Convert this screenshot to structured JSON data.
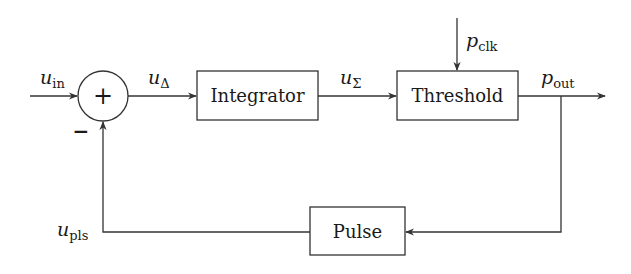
{
  "diagram": {
    "type": "control-loop block diagram",
    "colors": {
      "stroke": "#333333",
      "text": "#1a1a1a",
      "background": "#ffffff"
    },
    "summing_junction": {
      "symbol": "+",
      "feedback_sign": "−"
    },
    "blocks": {
      "integrator": "Integrator",
      "threshold": "Threshold",
      "pulse": "Pulse"
    },
    "signals": {
      "u_in": {
        "base": "u",
        "sub": "in"
      },
      "u_delta": {
        "base": "u",
        "sub": "Δ"
      },
      "u_sigma": {
        "base": "u",
        "sub": "Σ"
      },
      "p_clk": {
        "base": "p",
        "sub": "clk"
      },
      "p_out": {
        "base": "p",
        "sub": "out"
      },
      "u_pls": {
        "base": "u",
        "sub": "pls"
      }
    },
    "connections": [
      {
        "from": "u_in",
        "to": "summing_junction"
      },
      {
        "from": "summing_junction",
        "to": "integrator",
        "signal": "u_delta"
      },
      {
        "from": "integrator",
        "to": "threshold",
        "signal": "u_sigma"
      },
      {
        "from": "p_clk",
        "to": "threshold"
      },
      {
        "from": "threshold",
        "to": "output",
        "signal": "p_out"
      },
      {
        "from": "threshold",
        "to": "pulse",
        "signal": "p_out"
      },
      {
        "from": "pulse",
        "to": "summing_junction",
        "signal": "u_pls",
        "sign": "-"
      }
    ]
  }
}
